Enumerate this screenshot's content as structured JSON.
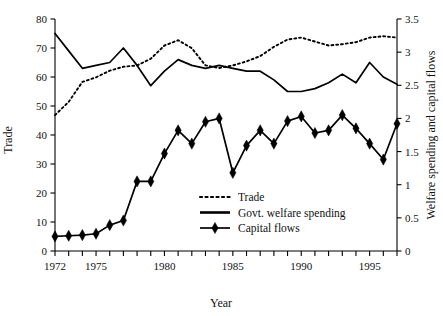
{
  "chart_data": {
    "type": "line",
    "title": "",
    "xlabel": "Year",
    "ylabel": "Trade",
    "y2label": "Welfare spending and capital flows",
    "x": [
      1972,
      1973,
      1974,
      1975,
      1976,
      1977,
      1978,
      1979,
      1980,
      1981,
      1982,
      1983,
      1984,
      1985,
      1986,
      1987,
      1988,
      1989,
      1990,
      1991,
      1992,
      1993,
      1994,
      1995,
      1996,
      1997
    ],
    "xlim": [
      1972,
      1997
    ],
    "ylim": [
      0,
      80
    ],
    "y2lim": [
      0,
      3.5
    ],
    "xticks": [
      1972,
      1973,
      1974,
      1975,
      1976,
      1977,
      1978,
      1979,
      1980,
      1981,
      1982,
      1983,
      1984,
      1985,
      1986,
      1987,
      1988,
      1989,
      1990,
      1991,
      1992,
      1993,
      1994,
      1995,
      1996,
      1997
    ],
    "xticklabels": [
      "1972",
      "",
      "",
      "1975",
      "",
      "",
      "",
      "",
      "1980",
      "",
      "",
      "",
      "",
      "1985",
      "",
      "",
      "",
      "",
      "1990",
      "",
      "",
      "",
      "",
      "1995",
      "",
      ""
    ],
    "yticks": [
      0,
      10,
      20,
      30,
      40,
      50,
      60,
      70,
      80
    ],
    "yticklabels": [
      "0",
      "10",
      "20",
      "30",
      "40",
      "50",
      "60",
      "70",
      "80"
    ],
    "y2ticks": [
      0,
      0.5,
      1,
      1.5,
      2,
      2.5,
      3,
      3.5
    ],
    "y2ticklabels": [
      "0",
      "0.5",
      "1",
      "1.5",
      "2",
      "2.5",
      "3",
      "3.5"
    ],
    "grid": false,
    "legend_position": "center",
    "series": [
      {
        "name": "Trade",
        "axis": "right",
        "style": "dotted",
        "marker": "none",
        "color": "#000000",
        "values": [
          2.05,
          2.25,
          2.55,
          2.62,
          2.72,
          2.78,
          2.8,
          2.9,
          3.1,
          3.18,
          3.06,
          2.8,
          2.76,
          2.8,
          2.86,
          2.94,
          3.08,
          3.19,
          3.22,
          3.16,
          3.1,
          3.12,
          3.15,
          3.22,
          3.24,
          3.22
        ]
      },
      {
        "name": "Govt. welfare spending",
        "axis": "left",
        "style": "solid",
        "marker": "none",
        "color": "#000000",
        "values": [
          75,
          69,
          63,
          64,
          65,
          70,
          64,
          57,
          62,
          66,
          64,
          63,
          64,
          63,
          62,
          62,
          59,
          55,
          55,
          56,
          58,
          61,
          58,
          65,
          60,
          57.5
        ]
      },
      {
        "name": "Capital flows",
        "axis": "right",
        "style": "solid",
        "marker": "diamond",
        "color": "#000000",
        "values": [
          0.22,
          0.23,
          0.24,
          0.26,
          0.39,
          0.46,
          1.05,
          1.05,
          1.47,
          1.82,
          1.62,
          1.95,
          2.0,
          1.18,
          1.59,
          1.82,
          1.62,
          1.96,
          2.03,
          1.78,
          1.82,
          2.05,
          1.85,
          1.62,
          1.38,
          1.92
        ]
      }
    ]
  },
  "legend": {
    "items": [
      {
        "label": "Trade",
        "style": "dotted"
      },
      {
        "label": "Govt. welfare spending",
        "style": "solid"
      },
      {
        "label": "Capital flows",
        "style": "solid-diamond"
      }
    ]
  }
}
